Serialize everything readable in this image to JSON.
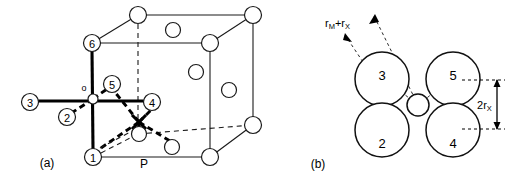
{
  "figure": {
    "background_color": "#ffffff",
    "line_color": "#1a1a1a",
    "panels": [
      {
        "id": "a",
        "caption": "(a)",
        "description": "face-centred cubic unit cell with octahedral coordination highlighted",
        "site_origin_label": "o",
        "corner_label": "P",
        "numbered_atoms": [
          "1",
          "2",
          "3",
          "4",
          "5",
          "6"
        ]
      },
      {
        "id": "b",
        "caption": "(b)",
        "description": "close packed spheres around a central interstitial site",
        "numbered_spheres": [
          "3",
          "5",
          "2",
          "4"
        ],
        "dimension_diagonal": {
          "prefix": "r",
          "sub1": "M",
          "plus": "+",
          "prefix2": "r",
          "sub2": "X"
        },
        "dimension_vertical": {
          "coefficient": "2",
          "prefix": "r",
          "sub": "X"
        }
      }
    ]
  },
  "panel_a": {
    "caption": "(a)",
    "origin_label": "o",
    "p_label": "P",
    "atoms": [
      {
        "label": "1",
        "cx": 93,
        "cy": 157,
        "r": 8.5
      },
      {
        "label": "2",
        "cx": 67,
        "cy": 117,
        "r": 8.5
      },
      {
        "label": "3",
        "cx": 30,
        "cy": 102,
        "r": 8.5
      },
      {
        "label": "4",
        "cx": 152,
        "cy": 102,
        "r": 8.5
      },
      {
        "label": "5",
        "cx": 112,
        "cy": 84,
        "r": 8.5
      },
      {
        "label": "6",
        "cx": 92,
        "cy": 43,
        "r": 8.5
      }
    ],
    "plain_atoms": [
      {
        "cx": 138,
        "cy": 15,
        "r": 8.5
      },
      {
        "cx": 253,
        "cy": 15,
        "r": 8.5
      },
      {
        "cx": 210,
        "cy": 43,
        "r": 8.5
      },
      {
        "cx": 210,
        "cy": 157,
        "r": 8.5
      },
      {
        "cx": 253,
        "cy": 125,
        "r": 8.5
      },
      {
        "cx": 173,
        "cy": 30,
        "r": 7.5
      },
      {
        "cx": 196,
        "cy": 72,
        "r": 7.5
      },
      {
        "cx": 229,
        "cy": 90,
        "r": 7.5
      },
      {
        "cx": 139,
        "cy": 134,
        "r": 7.5
      },
      {
        "cx": 172,
        "cy": 147,
        "r": 7.5
      }
    ]
  },
  "panel_b": {
    "caption": "(b)",
    "spheres": [
      {
        "label": "3",
        "cx": 382,
        "cy": 79,
        "r": 27
      },
      {
        "label": "5",
        "cx": 453,
        "cy": 79,
        "r": 27
      },
      {
        "label": "2",
        "cx": 382,
        "cy": 130,
        "r": 27
      },
      {
        "label": "4",
        "cx": 453,
        "cy": 130,
        "r": 27
      }
    ],
    "center_sphere": {
      "cx": 418,
      "cy": 105,
      "r": 11
    },
    "label_rm_rx": "r",
    "label_rm_rx_sub1": "M",
    "label_rm_rx_plus": "+",
    "label_rm_rx_prefix2": "r",
    "label_rm_rx_sub2": "X",
    "label_2rx_coef": "2",
    "label_2rx_r": "r",
    "label_2rx_sub": "X"
  }
}
